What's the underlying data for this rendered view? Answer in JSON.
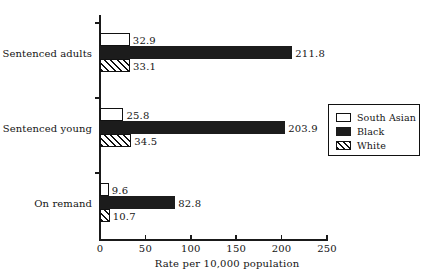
{
  "chart_data": {
    "type": "bar",
    "orientation": "horizontal",
    "title": "",
    "xlabel": "Rate per 10,000 population",
    "ylabel": "",
    "xlim": [
      0,
      250
    ],
    "xticks": [
      0,
      50,
      100,
      150,
      200,
      250
    ],
    "xtick_labels": [
      "0",
      "50",
      "100",
      "150",
      "200",
      "250"
    ],
    "grid": false,
    "legend_position": "right",
    "categories": [
      "Sentenced adults",
      "Sentenced young",
      "On remand"
    ],
    "series": [
      {
        "name": "South Asian",
        "color": "#ffffff",
        "pattern": "solid-outline",
        "values": [
          32.9,
          25.8,
          9.6
        ],
        "labels": [
          "32.9",
          "25.8",
          "9.6"
        ]
      },
      {
        "name": "Black",
        "color": "#1c1c1c",
        "pattern": "solid-fill",
        "values": [
          211.8,
          203.9,
          82.8
        ],
        "labels": [
          "211.8",
          "203.9",
          "82.8"
        ]
      },
      {
        "name": "White",
        "color": "#ffffff",
        "pattern": "diagonal-hatch",
        "values": [
          33.1,
          34.5,
          10.7
        ],
        "labels": [
          "33.1",
          "34.5",
          "10.7"
        ]
      }
    ]
  },
  "axis": {
    "x_title": "Rate per 10,000 population",
    "ticks": [
      {
        "value": "0"
      },
      {
        "value": "50"
      },
      {
        "value": "100"
      },
      {
        "value": "150"
      },
      {
        "value": "200"
      },
      {
        "value": "250"
      }
    ]
  },
  "categories": [
    {
      "label": "Sentenced adults"
    },
    {
      "label": "Sentenced young"
    },
    {
      "label": "On remand"
    }
  ],
  "legend": {
    "entries": [
      {
        "label": "South Asian"
      },
      {
        "label": "Black"
      },
      {
        "label": "White"
      }
    ]
  }
}
